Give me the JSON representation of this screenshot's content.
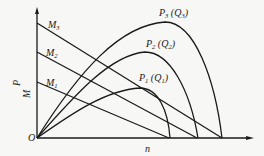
{
  "diagram": {
    "title": "",
    "axes": {
      "origin_label": "O",
      "x_label": "n",
      "y_label_top": "P",
      "y_label_bottom": "M"
    },
    "torque_lines": [
      {
        "name": "M",
        "sub": "3"
      },
      {
        "name": "M",
        "sub": "2"
      },
      {
        "name": "M",
        "sub": "1"
      }
    ],
    "power_curves": [
      {
        "name": "P",
        "sub": "3",
        "q": "Q",
        "qsub": "3"
      },
      {
        "name": "P",
        "sub": "2",
        "q": "Q",
        "qsub": "2"
      },
      {
        "name": "P",
        "sub": "1",
        "q": "Q",
        "qsub": "1"
      }
    ],
    "colors": {
      "line": "#1a1a1a",
      "background": "#f7f7f5"
    }
  }
}
